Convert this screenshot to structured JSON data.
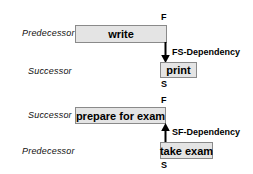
{
  "diagram": {
    "colors": {
      "box_fill": "#e4e4e4",
      "box_border": "#8a8a8a",
      "arrow": "#000000",
      "text": "#000000"
    },
    "groups": [
      {
        "id": "fs",
        "predecessor_label": "Predecessor",
        "successor_label": "Successor",
        "predecessor_task": "write",
        "successor_task": "print",
        "dependency_label": "FS-Dependency",
        "start_marker": "S",
        "finish_marker": "F",
        "arrow_direction": "down"
      },
      {
        "id": "sf",
        "predecessor_label": "Predecessor",
        "successor_label": "Successor",
        "predecessor_task": "take exam",
        "successor_task": "prepare for exam",
        "dependency_label": "SF-Dependency",
        "start_marker": "S",
        "finish_marker": "F",
        "arrow_direction": "up"
      }
    ]
  }
}
